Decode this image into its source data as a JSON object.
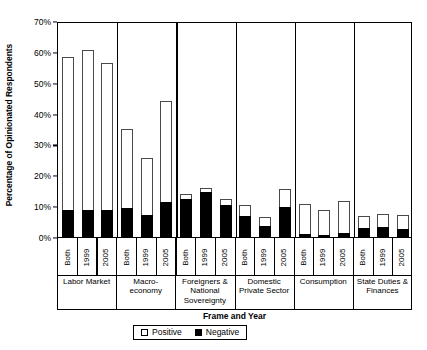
{
  "chart_data": {
    "type": "bar",
    "stacked": true,
    "title": "",
    "xlabel": "Frame and Year",
    "ylabel": "Percentage of Opinionated Respondents",
    "ylim": [
      0,
      70
    ],
    "ytick_labels": [
      "0%",
      "10%",
      "20%",
      "30%",
      "40%",
      "50%",
      "60%",
      "70%"
    ],
    "ytick_values": [
      0,
      10,
      20,
      30,
      40,
      50,
      60,
      70
    ],
    "grid": false,
    "legend_position": "below-axis-center",
    "legend": [
      {
        "name": "Positive",
        "swatch": "white-square-outline"
      },
      {
        "name": "Negative",
        "swatch": "black-square-filled"
      }
    ],
    "series": [
      {
        "name": "Negative",
        "color": "#000000"
      },
      {
        "name": "Positive",
        "color": "#ffffff"
      }
    ],
    "year_labels": [
      "Both",
      "1999",
      "2005"
    ],
    "groups": [
      {
        "frame": "Labor Market",
        "frame_lines": [
          "Labor Market"
        ],
        "bars": [
          {
            "year": "Both",
            "negative": 8.8,
            "positive": 49.7,
            "total": 58.5
          },
          {
            "year": "1999",
            "negative": 8.8,
            "positive": 51.9,
            "total": 60.7
          },
          {
            "year": "2005",
            "negative": 8.8,
            "positive": 47.7,
            "total": 56.5
          }
        ]
      },
      {
        "frame": "Macro-economy",
        "frame_lines": [
          "Macro-",
          "economy"
        ],
        "bars": [
          {
            "year": "Both",
            "negative": 9.4,
            "positive": 25.6,
            "total": 35.0
          },
          {
            "year": "1999",
            "negative": 7.0,
            "positive": 18.5,
            "total": 25.5
          },
          {
            "year": "2005",
            "negative": 11.2,
            "positive": 33.0,
            "total": 44.2
          }
        ]
      },
      {
        "frame": "Foreigners & National Sovereignty",
        "frame_lines": [
          "Foreigners &",
          "National",
          "Sovereignty"
        ],
        "bars": [
          {
            "year": "Both",
            "negative": 12.3,
            "positive": 1.5,
            "total": 13.8
          },
          {
            "year": "1999",
            "negative": 14.7,
            "positive": 1.3,
            "total": 16.0
          },
          {
            "year": "2005",
            "negative": 10.4,
            "positive": 1.8,
            "total": 12.2
          }
        ]
      },
      {
        "frame": "Domestic Private Sector",
        "frame_lines": [
          "Domestic",
          "Private Sector"
        ],
        "bars": [
          {
            "year": "Both",
            "negative": 6.9,
            "positive": 3.5,
            "total": 10.4
          },
          {
            "year": "1999",
            "negative": 3.6,
            "positive": 2.8,
            "total": 6.4
          },
          {
            "year": "2005",
            "negative": 9.8,
            "positive": 5.7,
            "total": 15.5
          }
        ]
      },
      {
        "frame": "Consumption",
        "frame_lines": [
          "Consumption"
        ],
        "bars": [
          {
            "year": "Both",
            "negative": 1.0,
            "positive": 9.7,
            "total": 10.7
          },
          {
            "year": "1999",
            "negative": 0.7,
            "positive": 8.0,
            "total": 8.7
          },
          {
            "year": "2005",
            "negative": 1.2,
            "positive": 10.6,
            "total": 11.8
          }
        ]
      },
      {
        "frame": "State Duties & Finances",
        "frame_lines": [
          "State Duties &",
          "Finances"
        ],
        "bars": [
          {
            "year": "Both",
            "negative": 2.9,
            "positive": 3.9,
            "total": 6.8
          },
          {
            "year": "1999",
            "negative": 3.4,
            "positive": 4.1,
            "total": 7.5
          },
          {
            "year": "2005",
            "negative": 2.5,
            "positive": 4.6,
            "total": 7.1
          }
        ]
      }
    ]
  }
}
